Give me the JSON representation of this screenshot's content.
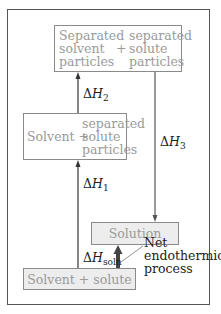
{
  "diagram": {
    "type": "enthalpy-of-solution-cycle",
    "boxes": {
      "top": {
        "left_lines": [
          "Separated",
          "solvent",
          "particles"
        ],
        "plus": "+",
        "right_lines": [
          "separated",
          "solute",
          "particles"
        ]
      },
      "middle": {
        "left": "Solvent +",
        "right_lines": [
          "separated",
          "solute",
          "particles"
        ]
      },
      "solution": {
        "label": "Solution"
      },
      "bottom": {
        "label": "Solvent + solute"
      }
    },
    "labels": {
      "dH2": {
        "delta": "Δ",
        "var": "H",
        "sub": "2"
      },
      "dH3": {
        "delta": "Δ",
        "var": "H",
        "sub": "3"
      },
      "dH1": {
        "delta": "Δ",
        "var": "H",
        "sub": "1"
      },
      "dHsoln": {
        "delta": "Δ",
        "var": "H",
        "sub": "soln"
      }
    },
    "annotation": {
      "lines": [
        "Net",
        "endothermic",
        "process"
      ]
    },
    "colors": {
      "box_text": "#9a9a9a",
      "box_border": "#8a8a8a",
      "arrow": "#333333",
      "thick_arrow": "#444444",
      "shaded_fill": "#ededed"
    }
  }
}
